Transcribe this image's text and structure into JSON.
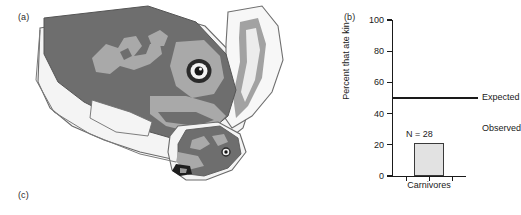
{
  "figure": {
    "panels": [
      {
        "key": "a",
        "label": "(a)"
      },
      {
        "key": "b",
        "label": "(b)"
      },
      {
        "key": "c",
        "label": "(c)"
      }
    ]
  },
  "illustration": {
    "name": "carnivore-head-illustration",
    "description": "Grayscale drawing of an adult carnivore head in profile with a pup",
    "colors": {
      "body_dark": "#6e6e6e",
      "patch_mid": "#a9a9a9",
      "pale": "#f2f2f2",
      "outline": "#5a5a5a",
      "eye_dark": "#1c1c1c",
      "eye_ring": "#f5f5f5"
    }
  },
  "chart_data": {
    "type": "bar",
    "title": "",
    "xlabel": "",
    "ylabel": "Percent that ate kin",
    "categories": [
      "Carnivores"
    ],
    "values": [
      21
    ],
    "ylim": [
      0,
      100
    ],
    "yticks": [
      0,
      20,
      40,
      60,
      80,
      100
    ],
    "ytick_labels": [
      "0",
      "20",
      "40",
      "60",
      "80",
      "100"
    ],
    "grid": false,
    "legend": "none",
    "bar_color": "#e2e2e2",
    "bar_edge_color": "#3a3a3a",
    "annotations": [
      {
        "name": "sample-size",
        "text": "N = 28",
        "value": 28
      },
      {
        "name": "observed-label",
        "text": "Observed"
      },
      {
        "name": "expected-label",
        "text": "Expected"
      }
    ],
    "reference_lines": [
      {
        "name": "expected-line",
        "label": "Expected",
        "y": 50,
        "color": "#1a1a1a"
      }
    ]
  }
}
